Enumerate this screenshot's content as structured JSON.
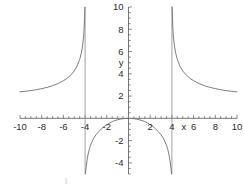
{
  "chart_data": {
    "type": "line",
    "title": "",
    "subtitle": "",
    "xlabel": "x",
    "ylabel": "y",
    "xlim": [
      -10,
      10
    ],
    "ylim": [
      -5,
      10
    ],
    "grid": false,
    "legend": null,
    "legend_position": "none",
    "x_ticks": [
      -10,
      -8,
      -6,
      -4,
      -2,
      2,
      4,
      6,
      8,
      10
    ],
    "x_tick_labels": [
      "-10",
      "-8",
      "-6",
      "-4",
      "-2",
      "2",
      "4",
      "6",
      "8",
      "10"
    ],
    "y_ticks": [
      -4,
      -2,
      2,
      4,
      6,
      8,
      10
    ],
    "y_tick_labels": [
      "-4",
      "-2",
      "2",
      "4",
      "6",
      "8",
      "10"
    ],
    "minor_tick_step": 0.5,
    "function": "y = 2x^2 / (x^2 - 16)",
    "vertical_asymptotes": [
      -4,
      4
    ],
    "horizontal_asymptote": 2,
    "curve_color": "#6e6e6e",
    "asymptote_color": "#8a8a8a",
    "axis_color": "#555555",
    "background_color": "#ffffff",
    "series": [
      {
        "name": "left-branch",
        "comment": "x from -10 to just left of -4; decreasing toward +infinity",
        "points": [
          [
            -10.0,
            2.38
          ],
          [
            -9.5,
            2.43
          ],
          [
            -9.0,
            2.49
          ],
          [
            -8.5,
            2.57
          ],
          [
            -8.0,
            2.67
          ],
          [
            -7.5,
            2.78
          ],
          [
            -7.0,
            2.93
          ],
          [
            -6.5,
            3.12
          ],
          [
            -6.0,
            3.38
          ],
          [
            -5.75,
            3.53
          ],
          [
            -5.5,
            3.73
          ],
          [
            -5.25,
            3.96
          ],
          [
            -5.0,
            4.26
          ],
          [
            -4.75,
            4.67
          ],
          [
            -4.5,
            5.29
          ],
          [
            -4.35,
            5.85
          ],
          [
            -4.25,
            6.39
          ],
          [
            -4.15,
            7.21
          ],
          [
            -4.1,
            7.88
          ],
          [
            -4.05,
            9.05
          ],
          [
            -4.02,
            10.0
          ]
        ]
      },
      {
        "name": "middle-branch",
        "comment": "x between -4 and 4; maximum y = 0 at x = 0",
        "points": [
          [
            -3.97,
            -5.0
          ],
          [
            -3.9,
            -4.38
          ],
          [
            -3.8,
            -3.62
          ],
          [
            -3.7,
            -3.11
          ],
          [
            -3.6,
            -2.72
          ],
          [
            -3.5,
            -2.41
          ],
          [
            -3.25,
            -1.86
          ],
          [
            -3.0,
            -1.48
          ],
          [
            -2.75,
            -1.19
          ],
          [
            -2.5,
            -0.95
          ],
          [
            -2.25,
            -0.74
          ],
          [
            -2.0,
            -0.57
          ],
          [
            -1.75,
            -0.42
          ],
          [
            -1.5,
            -0.29
          ],
          [
            -1.25,
            -0.2
          ],
          [
            -1.0,
            -0.13
          ],
          [
            -0.75,
            -0.07
          ],
          [
            -0.5,
            -0.03
          ],
          [
            -0.25,
            -0.01
          ],
          [
            0.0,
            0.0
          ],
          [
            0.25,
            -0.01
          ],
          [
            0.5,
            -0.03
          ],
          [
            0.75,
            -0.07
          ],
          [
            1.0,
            -0.13
          ],
          [
            1.25,
            -0.2
          ],
          [
            1.5,
            -0.29
          ],
          [
            1.75,
            -0.42
          ],
          [
            2.0,
            -0.57
          ],
          [
            2.25,
            -0.74
          ],
          [
            2.5,
            -0.95
          ],
          [
            2.75,
            -1.19
          ],
          [
            3.0,
            -1.48
          ],
          [
            3.25,
            -1.86
          ],
          [
            3.5,
            -2.41
          ],
          [
            3.6,
            -2.72
          ],
          [
            3.7,
            -3.11
          ],
          [
            3.8,
            -3.62
          ],
          [
            3.9,
            -4.38
          ],
          [
            3.97,
            -5.0
          ]
        ]
      },
      {
        "name": "right-branch",
        "comment": "x from just right of 4 to 10; decreasing toward y = 2",
        "points": [
          [
            4.02,
            10.0
          ],
          [
            4.05,
            9.05
          ],
          [
            4.1,
            7.88
          ],
          [
            4.15,
            7.21
          ],
          [
            4.25,
            6.39
          ],
          [
            4.35,
            5.85
          ],
          [
            4.5,
            5.29
          ],
          [
            4.75,
            4.67
          ],
          [
            5.0,
            4.26
          ],
          [
            5.25,
            3.96
          ],
          [
            5.5,
            3.73
          ],
          [
            5.75,
            3.53
          ],
          [
            6.0,
            3.38
          ],
          [
            6.5,
            3.12
          ],
          [
            7.0,
            2.93
          ],
          [
            7.5,
            2.78
          ],
          [
            8.0,
            2.67
          ],
          [
            8.5,
            2.57
          ],
          [
            9.0,
            2.49
          ],
          [
            9.5,
            2.43
          ],
          [
            10.0,
            2.38
          ]
        ]
      }
    ]
  },
  "caption": {
    "fragment": "1"
  }
}
